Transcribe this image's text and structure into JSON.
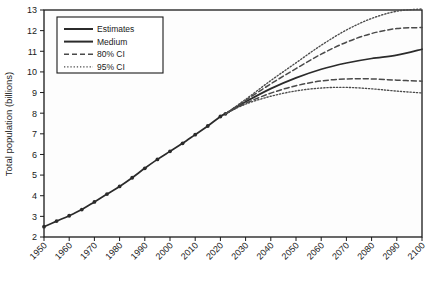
{
  "chart_data": {
    "type": "line",
    "title": "",
    "xlabel": "",
    "ylabel": "Total population (billions)",
    "xlim": [
      1950,
      2100
    ],
    "ylim": [
      2,
      13
    ],
    "grid": false,
    "legend_position": "top-left",
    "xticks": [
      1950,
      1960,
      1970,
      1980,
      1990,
      2000,
      2010,
      2020,
      2030,
      2040,
      2050,
      2060,
      2070,
      2080,
      2090,
      2100
    ],
    "xtick_labels": [
      "1950",
      "1960",
      "1970",
      "1980",
      "1990",
      "2000",
      "2010",
      "2020",
      "2030",
      "2040",
      "2050",
      "2060",
      "2070",
      "2080",
      "2090",
      "2100"
    ],
    "yticks": [
      2,
      3,
      4,
      5,
      6,
      7,
      8,
      9,
      10,
      11,
      12,
      13
    ],
    "ytick_labels": [
      "2",
      "3",
      "4",
      "5",
      "6",
      "7",
      "8",
      "9",
      "10",
      "11",
      "12",
      "13"
    ],
    "legend": [
      {
        "label": "Estimates",
        "style": "solid-marker",
        "color": "#2b2b2b"
      },
      {
        "label": "Medium",
        "style": "solid",
        "color": "#2b2b2b"
      },
      {
        "label": "80% CI",
        "style": "dashed",
        "color": "#4a4a4a"
      },
      {
        "label": "95% CI",
        "style": "dotted",
        "color": "#4a4a4a"
      }
    ],
    "series": [
      {
        "name": "Estimates",
        "style": "solid-marker",
        "color": "#2b2b2b",
        "x": [
          1950,
          1955,
          1960,
          1965,
          1970,
          1975,
          1980,
          1985,
          1990,
          1995,
          2000,
          2005,
          2010,
          2015,
          2020,
          2022
        ],
        "values": [
          2.5,
          2.77,
          3.03,
          3.33,
          3.7,
          4.08,
          4.45,
          4.87,
          5.33,
          5.76,
          6.15,
          6.54,
          6.96,
          7.38,
          7.84,
          7.97
        ]
      },
      {
        "name": "Medium",
        "style": "solid",
        "color": "#2b2b2b",
        "x": [
          2022,
          2030,
          2040,
          2050,
          2060,
          2070,
          2080,
          2090,
          2100
        ],
        "values": [
          7.97,
          8.55,
          9.19,
          9.71,
          10.13,
          10.43,
          10.65,
          10.81,
          11.1
        ]
      },
      {
        "name": "80% CI upper",
        "style": "dashed",
        "color": "#4a4a4a",
        "x": [
          2022,
          2030,
          2040,
          2050,
          2060,
          2070,
          2080,
          2090,
          2100
        ],
        "values": [
          7.97,
          8.62,
          9.42,
          10.16,
          10.86,
          11.44,
          11.86,
          12.1,
          12.15
        ]
      },
      {
        "name": "80% CI lower",
        "style": "dashed",
        "color": "#4a4a4a",
        "x": [
          2022,
          2030,
          2040,
          2050,
          2060,
          2070,
          2080,
          2090,
          2100
        ],
        "values": [
          7.97,
          8.48,
          8.97,
          9.33,
          9.56,
          9.66,
          9.66,
          9.6,
          9.55
        ]
      },
      {
        "name": "95% CI upper",
        "style": "dotted",
        "color": "#4a4a4a",
        "x": [
          2022,
          2030,
          2040,
          2050,
          2060,
          2070,
          2080,
          2090,
          2100
        ],
        "values": [
          7.97,
          8.67,
          9.58,
          10.44,
          11.29,
          12.03,
          12.59,
          12.94,
          13.05
        ]
      },
      {
        "name": "95% CI lower",
        "style": "dotted",
        "color": "#4a4a4a",
        "x": [
          2022,
          2030,
          2040,
          2050,
          2060,
          2070,
          2080,
          2090,
          2100
        ],
        "values": [
          7.97,
          8.44,
          8.82,
          9.08,
          9.22,
          9.25,
          9.18,
          9.07,
          8.98
        ]
      }
    ]
  }
}
